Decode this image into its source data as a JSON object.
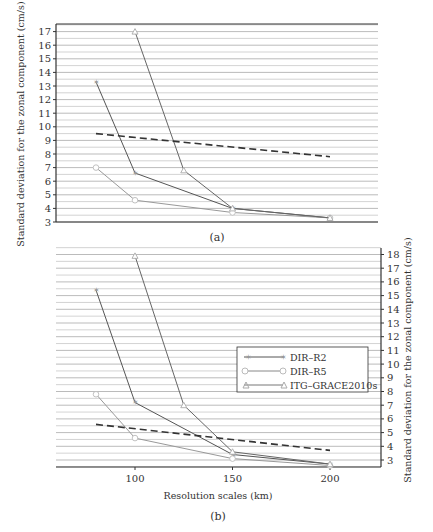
{
  "chart_data": [
    {
      "type": "line",
      "panel_label": "(a)",
      "title": "",
      "xlabel": "",
      "ylabel": "Standard deviation for the zonal component (cm/s)",
      "ylim": [
        3,
        17.5
      ],
      "yticks": [
        3,
        4,
        5,
        6,
        7,
        8,
        9,
        10,
        11,
        12,
        13,
        14,
        15,
        16,
        17
      ],
      "y_axis_side": "left",
      "grid": "horizontal, every 0.5",
      "x": [
        80,
        100,
        125,
        150,
        200
      ],
      "series": [
        {
          "name": "DIR-R2",
          "marker": "star",
          "x": [
            80,
            100,
            150,
            200
          ],
          "values": [
            13.3,
            6.6,
            4.0,
            3.3
          ]
        },
        {
          "name": "DIR-R5",
          "marker": "circle",
          "x": [
            80,
            100,
            150,
            200
          ],
          "values": [
            7.0,
            4.6,
            3.7,
            3.3
          ]
        },
        {
          "name": "ITG-GRACE2010s",
          "marker": "triangle",
          "x": [
            100,
            125,
            150,
            200
          ],
          "values": [
            17.0,
            6.8,
            4.0,
            3.3
          ]
        },
        {
          "name": "reference (dashed)",
          "style": "dashed",
          "x": [
            80,
            200
          ],
          "values": [
            9.5,
            7.8
          ]
        }
      ]
    },
    {
      "type": "line",
      "panel_label": "(b)",
      "title": "",
      "xlabel": "Resolution scales (km)",
      "xticks": [
        100,
        150,
        200
      ],
      "ylabel": "Standard deviation for the zonal component (cm/s)",
      "ylim": [
        2.5,
        18.5
      ],
      "yticks": [
        3,
        4,
        5,
        6,
        7,
        8,
        9,
        10,
        11,
        12,
        13,
        14,
        15,
        16,
        17,
        18
      ],
      "y_axis_side": "right",
      "grid": "horizontal, every 0.5",
      "legend": [
        "DIR-R2",
        "DIR-R5",
        "ITG-GRACE2010s"
      ],
      "legend_position": "right-center",
      "series": [
        {
          "name": "DIR-R2",
          "marker": "star",
          "x": [
            80,
            100,
            150,
            200
          ],
          "values": [
            15.4,
            7.2,
            3.4,
            2.7
          ]
        },
        {
          "name": "DIR-R5",
          "marker": "circle",
          "x": [
            80,
            100,
            150,
            200
          ],
          "values": [
            7.8,
            4.6,
            3.1,
            2.6
          ]
        },
        {
          "name": "ITG-GRACE2010s",
          "marker": "triangle",
          "x": [
            100,
            125,
            150,
            200
          ],
          "values": [
            17.9,
            7.0,
            3.6,
            2.7
          ]
        },
        {
          "name": "reference (dashed)",
          "style": "dashed",
          "x": [
            80,
            200
          ],
          "values": [
            5.6,
            3.7
          ]
        }
      ]
    }
  ],
  "labels": {
    "panel_a": "(a)",
    "panel_b": "(b)",
    "ylabel": "Standard deviation for the zonal component (cm/s)",
    "xlabel": "Resolution scales (km)",
    "legend": {
      "r2": "DIR–R2",
      "r5": "DIR–R5",
      "itg": "ITG–GRACE2010s"
    }
  }
}
